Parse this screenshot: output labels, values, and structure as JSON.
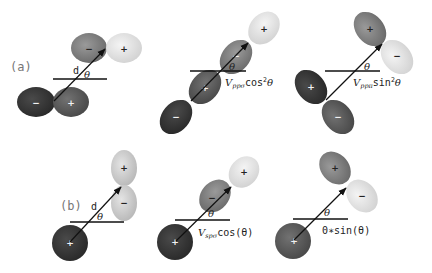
{
  "figure": {
    "colors": {
      "lobe_darkest": "#2e2e2e",
      "lobe_dark": "#555555",
      "lobe_mid": "#7a7a7a",
      "lobe_light": "#c8c8c8",
      "lobe_lightest": "#e6e6e6",
      "line": "#111111",
      "label_gray": "#777777"
    },
    "panel_a": {
      "label": "(a)",
      "diagrams": [
        {
          "name": "pp-reference",
          "distance_label": "d",
          "angle_label": "θ",
          "lower_orbital": {
            "type": "p",
            "signs": [
              "−",
              "+"
            ]
          },
          "upper_orbital": {
            "type": "p",
            "signs": [
              "−",
              "+"
            ]
          }
        },
        {
          "name": "pp-sigma",
          "angle_label": "θ",
          "formula": {
            "prefix": "V",
            "subscript": "ppσ",
            "body": "cos",
            "superscript": "2",
            "suffix": "θ"
          },
          "lower_orbital": {
            "type": "p",
            "signs": [
              "−",
              "+"
            ]
          },
          "upper_orbital": {
            "type": "p",
            "signs": [
              "−",
              "+"
            ]
          }
        },
        {
          "name": "pp-pi",
          "angle_label": "θ",
          "formula": {
            "prefix": "V",
            "subscript": "ppπ",
            "body": "sin",
            "superscript": "2",
            "suffix": "θ"
          },
          "lower_orbital": {
            "type": "p",
            "signs": [
              "+",
              "−"
            ]
          },
          "upper_orbital": {
            "type": "p",
            "signs": [
              "+",
              "−"
            ]
          }
        }
      ]
    },
    "panel_b": {
      "label": "(b)",
      "diagrams": [
        {
          "name": "sp-reference",
          "distance_label": "d",
          "angle_label": "θ",
          "s_orbital": {
            "type": "s",
            "sign": "+"
          },
          "p_orbital": {
            "type": "p",
            "signs": [
              "+",
              "−"
            ]
          }
        },
        {
          "name": "sp-sigma",
          "angle_label": "θ",
          "formula": {
            "prefix": "V",
            "subscript": "spσ",
            "body": "cos(θ)"
          },
          "s_orbital": {
            "type": "s",
            "sign": "+"
          },
          "p_orbital": {
            "type": "p",
            "signs": [
              "−",
              "+"
            ]
          }
        },
        {
          "name": "sp-perpendicular",
          "angle_label": "θ",
          "formula": {
            "text": "0∗sin(θ)"
          },
          "s_orbital": {
            "type": "s",
            "sign": "+"
          },
          "p_orbital": {
            "type": "p",
            "signs": [
              "+",
              "−"
            ]
          }
        }
      ]
    }
  }
}
